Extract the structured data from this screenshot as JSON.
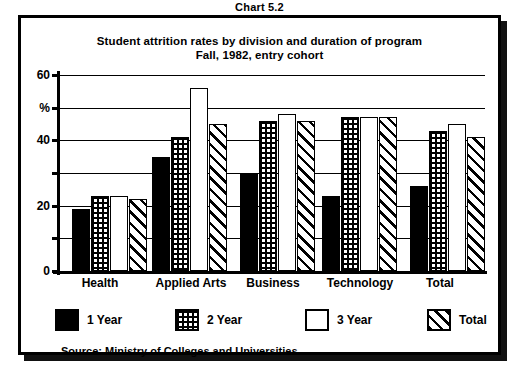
{
  "chart_number": "Chart 5.2",
  "titles": {
    "line1": "Student attrition rates by division and duration of program",
    "line2": "Fall, 1982, entry cohort"
  },
  "source": "Source: Ministry of Colleges and Universities",
  "axis": {
    "y_unit": "%",
    "ticks": [
      "60",
      "50",
      "40",
      "30",
      "20",
      "10",
      "0"
    ],
    "labelled_ticks": [
      "60",
      "40",
      "20",
      "0"
    ]
  },
  "legend": {
    "items": [
      {
        "label": "1 Year",
        "swatch": "solid-black-swatch"
      },
      {
        "label": "2 Year",
        "swatch": "grid-hatch-swatch"
      },
      {
        "label": "3 Year",
        "swatch": "white-empty-swatch"
      },
      {
        "label": "Total",
        "swatch": "diagonal-hatch-swatch"
      }
    ]
  },
  "chart_data": {
    "type": "bar",
    "xlabel": "",
    "ylabel": "%",
    "ylim": [
      0,
      60
    ],
    "yticks": [
      0,
      10,
      20,
      30,
      40,
      50,
      60
    ],
    "grid": true,
    "legend_position": "bottom",
    "categories": [
      "Health",
      "Applied Arts",
      "Business",
      "Technology",
      "Total"
    ],
    "series": [
      {
        "name": "1 Year",
        "values": [
          19,
          35,
          30,
          23,
          26
        ]
      },
      {
        "name": "2 Year",
        "values": [
          23,
          41,
          46,
          47,
          43
        ]
      },
      {
        "name": "3 Year",
        "values": [
          23,
          56,
          48,
          47,
          45
        ]
      },
      {
        "name": "Total",
        "values": [
          22,
          45,
          46,
          47,
          41
        ]
      }
    ]
  },
  "layout": {
    "group_left_px": [
      12,
      92,
      180,
      262,
      350
    ],
    "bar_width_px": 18,
    "cat_left_px": [
      8,
      86,
      176,
      258,
      348
    ],
    "cat_width_px": [
      70,
      96,
      80,
      90,
      70
    ],
    "legend_left_px": [
      0,
      120,
      250,
      372
    ]
  },
  "colors": {
    "ink": "#000000",
    "paper": "#ffffff"
  }
}
